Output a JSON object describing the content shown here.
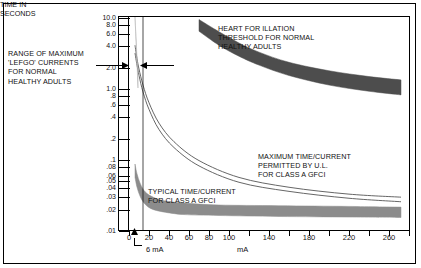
{
  "chart_data": {
    "type": "area",
    "title": "",
    "xlabel": "mA",
    "ylabel": "TIME IN SECONDS",
    "xlim": [
      0,
      280
    ],
    "ylim": [
      0.01,
      10.0
    ],
    "yscale": "log",
    "grid": false,
    "legend": "none",
    "y_ticks": [
      "10.0",
      "8.0",
      "6.0",
      "4.0",
      "2.0",
      "1.0",
      ".8",
      ".6",
      ".4",
      ".2",
      ".1",
      ".08",
      ".06",
      ".05",
      ".04",
      ".03",
      ".02",
      ".01"
    ],
    "y_tick_values": [
      10.0,
      8.0,
      6.0,
      4.0,
      2.0,
      1.0,
      0.8,
      0.6,
      0.4,
      0.2,
      0.1,
      0.08,
      0.06,
      0.05,
      0.04,
      0.03,
      0.02,
      0.01
    ],
    "x_ticks": [
      "0",
      "20",
      "40",
      "60",
      "80",
      "100",
      "140",
      "180",
      "220",
      "260"
    ],
    "x_tick_values": [
      0,
      20,
      40,
      60,
      80,
      100,
      140,
      180,
      220,
      260
    ],
    "markers": [
      {
        "name": "6 mA",
        "x": 6,
        "label": "6 mA"
      }
    ],
    "series": [
      {
        "name": "HEART FOR ILLATION THRESHOLD FOR NORMAL HEALTHY ADULTS",
        "kind": "band",
        "color": "#4d4d4d",
        "x": [
          70,
          90,
          110,
          130,
          160,
          200,
          240,
          272
        ],
        "upper": [
          9.2,
          6.2,
          4.3,
          3.2,
          2.3,
          1.75,
          1.45,
          1.3
        ],
        "lower": [
          6.3,
          4.0,
          2.8,
          2.1,
          1.5,
          1.1,
          0.9,
          0.8
        ]
      },
      {
        "name": "MAXIMUM TIME/CURRENT PERMITTED BY U.L. FOR CLASS A GFCI",
        "kind": "line-pair",
        "color": "#555555",
        "x": [
          6,
          8,
          10,
          14,
          20,
          30,
          45,
          70,
          110,
          160,
          220,
          272
        ],
        "upper": [
          4.0,
          2.6,
          1.85,
          1.1,
          0.62,
          0.32,
          0.175,
          0.095,
          0.055,
          0.04,
          0.032,
          0.029
        ],
        "lower": [
          3.1,
          2.1,
          1.5,
          0.88,
          0.5,
          0.26,
          0.145,
          0.08,
          0.047,
          0.035,
          0.028,
          0.025
        ]
      },
      {
        "name": "TYPICAL TIME/CURRENT FOR CLASS A GFCI",
        "kind": "band",
        "color": "#8c8c8c",
        "x": [
          6,
          8,
          11,
          15,
          22,
          34,
          55,
          90,
          150,
          220,
          272
        ],
        "upper": [
          0.085,
          0.062,
          0.046,
          0.036,
          0.03,
          0.026,
          0.024,
          0.0225,
          0.022,
          0.0215,
          0.021
        ],
        "lower": [
          0.055,
          0.04,
          0.03,
          0.024,
          0.02,
          0.018,
          0.0165,
          0.016,
          0.0155,
          0.0152,
          0.015
        ]
      },
      {
        "name": "RANGE OF MAXIMUM LET-GO CURRENTS FOR NORMAL HEALTHY ADULTS",
        "kind": "band",
        "color": "#b3b3b3",
        "x": [
          6,
          9
        ],
        "upper": [
          10.0,
          1.4
        ],
        "lower": [
          10.0,
          1.0
        ]
      }
    ]
  },
  "annotations": {
    "letgo": "RANGE OF MAXIMUM\n'LEFGO' CURRENTS\nFOR NORMAL\nHEALTHY ADULTS",
    "fibrillation": "HEART FOR ILLATION\nTHRESHOLD FOR NORMAL\nHEALTHY ADULTS",
    "ul_max": "MAXIMUM TIME/CURRENT\nPERMITTED BY U.L.\nFOR CLASS A GFCI",
    "typical": "TYPICAL TIME/CURRENT\nFOR CLASS A GFCI",
    "axis_title": "TIME IN\nSECONDS",
    "x_axis_unit": "mA",
    "six_ma": "6 mA"
  }
}
